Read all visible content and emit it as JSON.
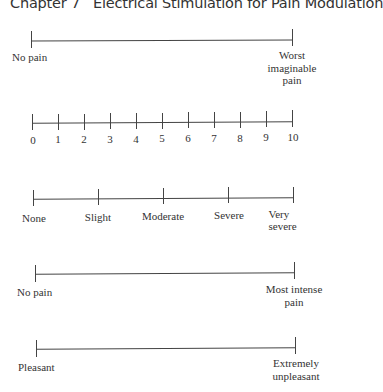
{
  "header": {
    "chapter": "Chapter 7",
    "title": "Electrical Stimulation for Pain Modulation"
  },
  "scales": [
    {
      "name": "vas-pain",
      "left_label": "No pain",
      "right_label_lines": [
        "Worst",
        "imaginable",
        "pain"
      ]
    },
    {
      "name": "numeric-rating-scale",
      "ticks": [
        "0",
        "1",
        "2",
        "3",
        "4",
        "5",
        "6",
        "7",
        "8",
        "9",
        "10"
      ]
    },
    {
      "name": "verbal-rating-scale",
      "ticks": [
        "None",
        "Slight",
        "Moderate",
        "Severe",
        "Very severe"
      ]
    },
    {
      "name": "vas-intensity",
      "left_label": "No pain",
      "right_label_lines": [
        "Most intense",
        "pain"
      ]
    },
    {
      "name": "vas-unpleasantness",
      "left_label": "Pleasant",
      "right_label_lines": [
        "Extremely",
        "unpleasant"
      ]
    }
  ]
}
